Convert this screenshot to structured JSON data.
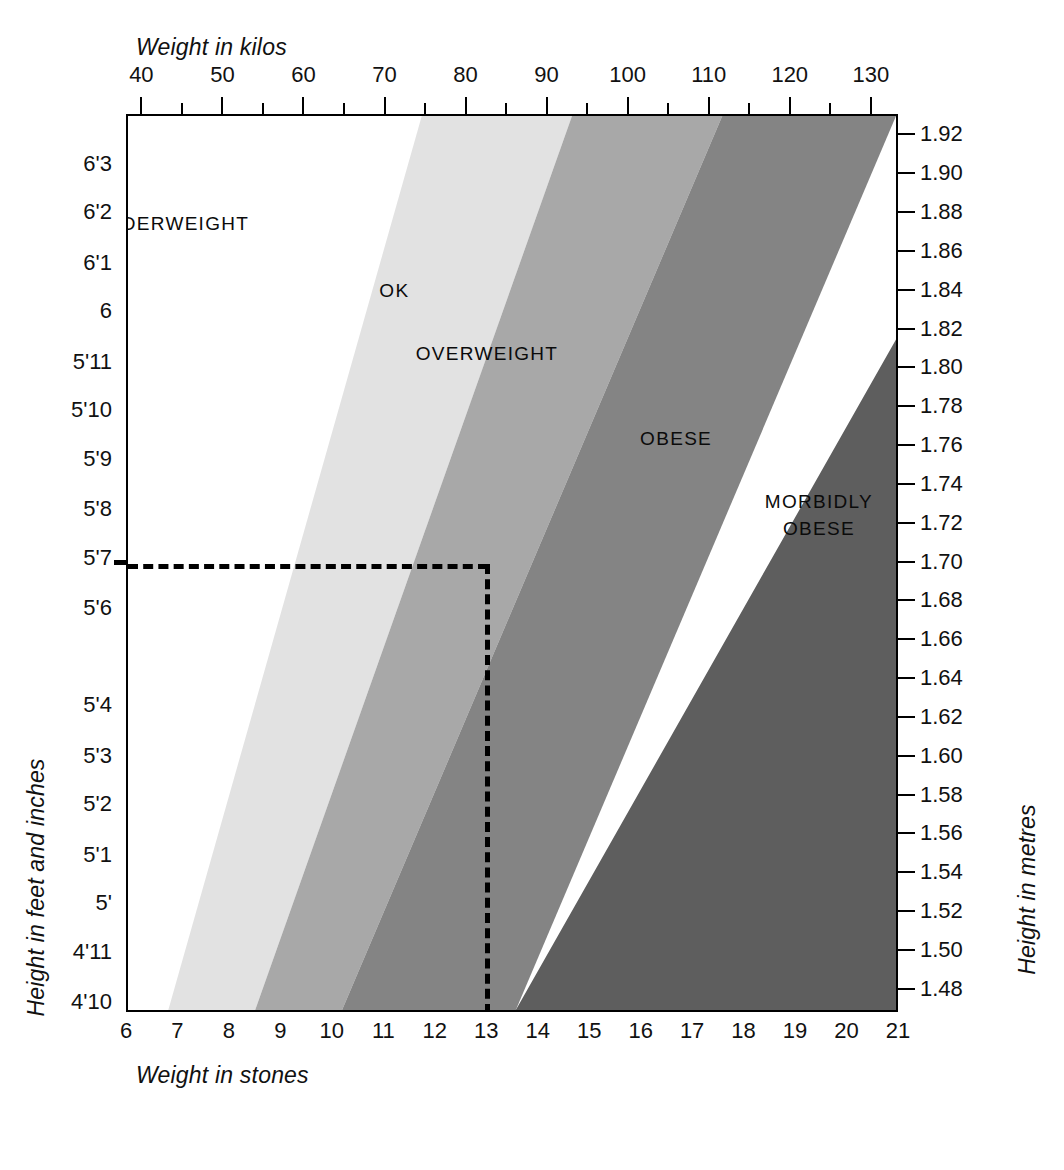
{
  "chart_data": {
    "type": "heatmap",
    "xlabel": "Weight in stones",
    "ylabel": "Height in feet and inches",
    "xlabel_top": "Weight in kilos",
    "ylabel_right": "Height in metres",
    "grid": false,
    "legend_position": "inline-band-labels",
    "x_axis_top": {
      "name": "Weight in kilos",
      "min": 38.1,
      "max": 133.4,
      "major_step": 10,
      "minor_step": 5,
      "tick_labels": [
        "40",
        "50",
        "60",
        "70",
        "80",
        "90",
        "100",
        "110",
        "120",
        "130"
      ],
      "tick_values": [
        40,
        50,
        60,
        70,
        80,
        90,
        100,
        110,
        120,
        130
      ],
      "minor_tick_values": [
        40,
        45,
        50,
        55,
        60,
        65,
        70,
        75,
        80,
        85,
        90,
        95,
        100,
        105,
        110,
        115,
        120,
        125,
        130
      ]
    },
    "x_axis_bottom": {
      "name": "Weight in stones",
      "min": 6,
      "max": 21,
      "step": 1,
      "tick_labels": [
        "6",
        "7",
        "8",
        "9",
        "10",
        "11",
        "12",
        "13",
        "14",
        "15",
        "16",
        "17",
        "18",
        "19",
        "20",
        "21"
      ],
      "tick_values": [
        6,
        7,
        8,
        9,
        10,
        11,
        12,
        13,
        14,
        15,
        16,
        17,
        18,
        19,
        20,
        21
      ]
    },
    "y_axis_left": {
      "name": "Height in feet and inches",
      "tick_labels": [
        "6'3",
        "6'2",
        "6'1",
        "6",
        "5'11",
        "5'10",
        "5'9",
        "5'8",
        "5'7",
        "5'6",
        "5'4",
        "5'3",
        "5'2",
        "5'1",
        "5'",
        "4'11",
        "4'10"
      ],
      "tick_metres": [
        1.905,
        1.88,
        1.854,
        1.829,
        1.803,
        1.778,
        1.753,
        1.727,
        1.702,
        1.676,
        1.626,
        1.6,
        1.575,
        1.549,
        1.524,
        1.499,
        1.473
      ]
    },
    "y_axis_right": {
      "name": "Height in metres",
      "min": 1.47,
      "max": 1.93,
      "step": 0.02,
      "tick_labels": [
        "1.92",
        "1.90",
        "1.88",
        "1.86",
        "1.84",
        "1.82",
        "1.80",
        "1.78",
        "1.76",
        "1.74",
        "1.72",
        "1.70",
        "1.68",
        "1.66",
        "1.64",
        "1.62",
        "1.60",
        "1.58",
        "1.56",
        "1.54",
        "1.52",
        "1.50",
        "1.48"
      ],
      "tick_values": [
        1.92,
        1.9,
        1.88,
        1.86,
        1.84,
        1.82,
        1.8,
        1.78,
        1.76,
        1.74,
        1.72,
        1.7,
        1.68,
        1.66,
        1.64,
        1.62,
        1.6,
        1.58,
        1.56,
        1.54,
        1.52,
        1.5,
        1.48
      ]
    },
    "bands": [
      {
        "name": "UNDERWEIGHT",
        "color": "#ffffff",
        "bmi_range": [
          0,
          20
        ],
        "label_x_frac": 0.055,
        "label_y_frac": 0.12
      },
      {
        "name": "OK",
        "color": "#e2e2e2",
        "bmi_range": [
          20,
          25
        ],
        "label_x_frac": 0.345,
        "label_y_frac": 0.195
      },
      {
        "name": "OVERWEIGHT",
        "color": "#a8a8a8",
        "bmi_range": [
          25,
          30
        ],
        "label_x_frac": 0.465,
        "label_y_frac": 0.265
      },
      {
        "name": "OBESE",
        "color": "#848484",
        "bmi_range": [
          30,
          40
        ],
        "label_x_frac": 0.71,
        "label_y_frac": 0.36
      },
      {
        "name": "MORBIDLY OBESE",
        "color": "#5e5e5e",
        "bmi_range": [
          40,
          100
        ],
        "label_x_frac": 0.895,
        "label_y_frac": 0.445
      }
    ],
    "boundaries_px": {
      "note": "x positions of band edges measured at the top and bottom of the plot area",
      "top_y": 114,
      "bottom_y": 1012,
      "plot_left": 126,
      "plot_right": 898,
      "edges_top": [
        365,
        570,
        705,
        890
      ],
      "edges_bottom": [
        135,
        245,
        355,
        495
      ]
    },
    "reader_lines": {
      "style": "dashed",
      "color": "#000000",
      "height_marker": "5'7",
      "height_metres_marker": 1.7,
      "weight_marker_stones": 13,
      "weight_marker_kilos": 82.6,
      "horizontal_from_x": 126,
      "horizontal_to_x": 493,
      "horizontal_y": 583,
      "vertical_x": 493,
      "vertical_from_y": 583,
      "vertical_to_y": 1012
    }
  }
}
